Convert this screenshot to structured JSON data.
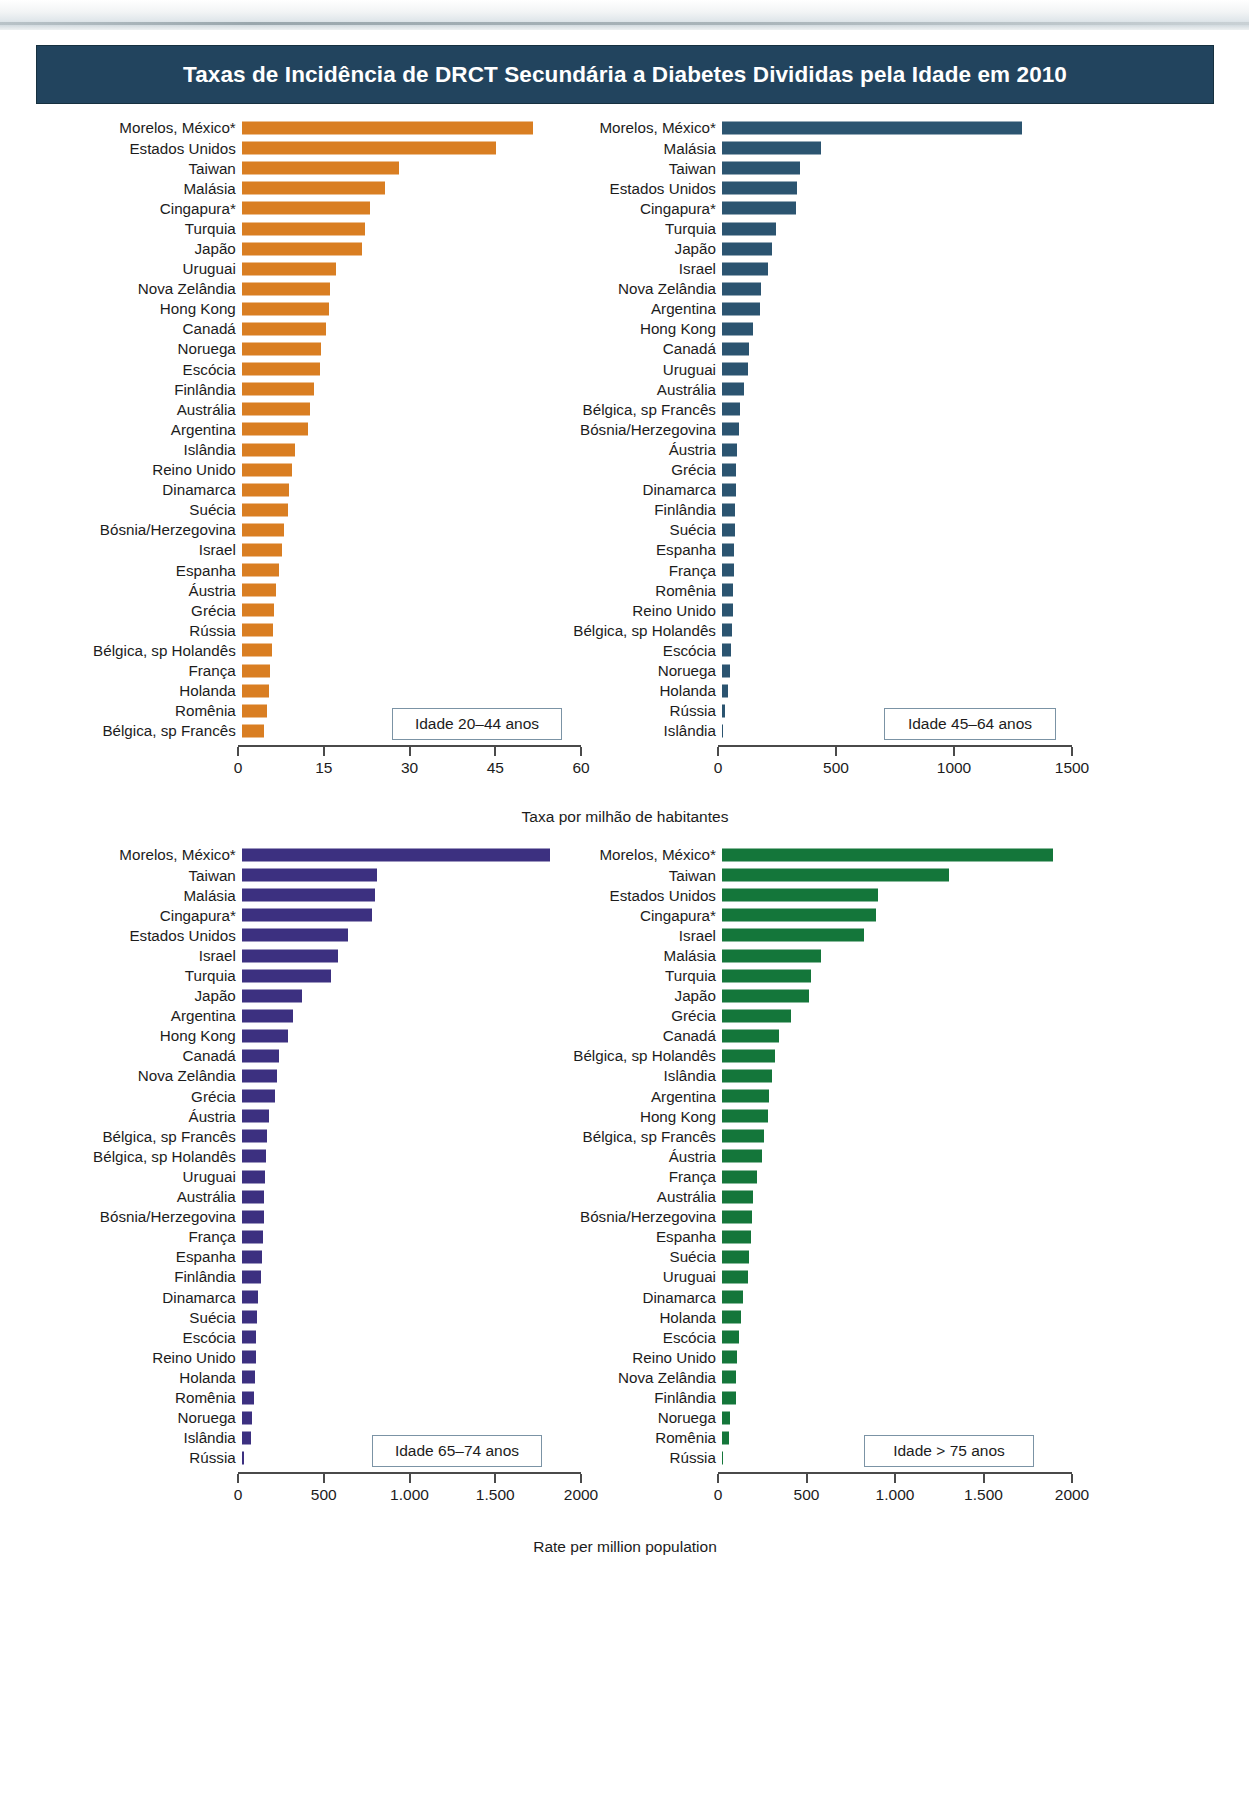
{
  "page": {
    "scan_ghost_text": "",
    "title": "Taxas de Incidência de DRCT Secundária a Diabetes Divididas pela Idade em 2010",
    "top_axis_title": "Taxa por milhão de habitantes",
    "bottom_axis_title": "Rate per million population"
  },
  "colors": {
    "banner_bg": "#22445e",
    "banner_text": "#ffffff",
    "orange": "#d97e22",
    "navy": "#2b5470",
    "purple": "#3c3080",
    "green": "#14763a",
    "axis": "#4a4a4a",
    "legend_border": "#7b93a5"
  },
  "legends": {
    "panel1": "Idade 20–44 anos",
    "panel2": "Idade 45–64 anos",
    "panel3": "Idade 65–74 anos",
    "panel4": "Idade > 75 anos"
  },
  "chart_data": [
    {
      "id": "panel1",
      "type": "bar",
      "orientation": "horizontal",
      "title": "Idade 20–44 anos",
      "color": "#d97e22",
      "xlabel": "Taxa por milhão de habitantes",
      "ylabel": "",
      "xlim": [
        0,
        60
      ],
      "xticks": [
        0,
        15,
        30,
        45,
        60
      ],
      "xtick_labels": [
        "0",
        "15",
        "30",
        "45",
        "60"
      ],
      "grid": false,
      "legend_position": "inside-bottom-right",
      "categories": [
        "Morelos, México*",
        "Estados Unidos",
        "Taiwan",
        "Malásia",
        "Cingapura*",
        "Turquia",
        "Japão",
        "Uruguai",
        "Nova Zelândia",
        "Hong Kong",
        "Canadá",
        "Noruega",
        "Escócia",
        "Finlândia",
        "Austrália",
        "Argentina",
        "Islândia",
        "Reino Unido",
        "Dinamarca",
        "Suécia",
        "Bósnia/Herzegovina",
        "Israel",
        "Espanha",
        "Áustria",
        "Grécia",
        "Rússia",
        "Bélgica, sp Holandês",
        "França",
        "Holanda",
        "Romênia",
        "Bélgica, sp Francês"
      ],
      "values": [
        51.0,
        44.5,
        27.5,
        25.0,
        22.5,
        21.5,
        21.0,
        16.5,
        15.5,
        15.3,
        14.8,
        13.8,
        13.6,
        12.6,
        12.0,
        11.5,
        9.3,
        8.7,
        8.3,
        8.0,
        7.3,
        7.0,
        6.5,
        5.9,
        5.7,
        5.5,
        5.3,
        4.9,
        4.8,
        4.4,
        3.8
      ]
    },
    {
      "id": "panel2",
      "type": "bar",
      "orientation": "horizontal",
      "title": "Idade 45–64 anos",
      "color": "#2b5470",
      "xlabel": "Taxa por milhão de habitantes",
      "ylabel": "",
      "xlim": [
        0,
        1500
      ],
      "xticks": [
        0,
        500,
        1000,
        1500
      ],
      "xtick_labels": [
        "0",
        "500",
        "1000",
        "1500"
      ],
      "grid": false,
      "legend_position": "inside-bottom-right",
      "categories": [
        "Morelos, México*",
        "Malásia",
        "Taiwan",
        "Estados Unidos",
        "Cingapura*",
        "Turquia",
        "Japão",
        "Israel",
        "Nova Zelândia",
        "Argentina",
        "Hong Kong",
        "Canadá",
        "Uruguai",
        "Austrália",
        "Bélgica, sp Francês",
        "Bósnia/Herzegovina",
        "Áustria",
        "Grécia",
        "Dinamarca",
        "Finlândia",
        "Suécia",
        "Espanha",
        "França",
        "Romênia",
        "Reino Unido",
        "Bélgica, sp Holandês",
        "Escócia",
        "Noruega",
        "Holanda",
        "Rússia",
        "Islândia"
      ],
      "values": [
        1270,
        420,
        330,
        320,
        315,
        230,
        210,
        195,
        165,
        160,
        130,
        115,
        110,
        95,
        78,
        72,
        62,
        60,
        58,
        56,
        54,
        52,
        50,
        48,
        46,
        44,
        38,
        32,
        26,
        15,
        3
      ]
    },
    {
      "id": "panel3",
      "type": "bar",
      "orientation": "horizontal",
      "title": "Idade 65–74 anos",
      "color": "#3c3080",
      "xlabel": "Rate per million population",
      "ylabel": "",
      "xlim": [
        0,
        2000
      ],
      "xticks": [
        0,
        500,
        1000,
        1500,
        2000
      ],
      "xtick_labels": [
        "0",
        "500",
        "1.000",
        "1.500",
        "2000"
      ],
      "grid": false,
      "legend_position": "inside-bottom-right",
      "categories": [
        "Morelos, México*",
        "Taiwan",
        "Malásia",
        "Cingapura*",
        "Estados Unidos",
        "Israel",
        "Turquia",
        "Japão",
        "Argentina",
        "Hong Kong",
        "Canadá",
        "Nova Zelândia",
        "Grécia",
        "Áustria",
        "Bélgica, sp Francês",
        "Bélgica, sp Holandês",
        "Uruguai",
        "Austrália",
        "Bósnia/Herzegovina",
        "França",
        "Espanha",
        "Finlândia",
        "Dinamarca",
        "Suécia",
        "Escócia",
        "Reino Unido",
        "Holanda",
        "Romênia",
        "Noruega",
        "Islândia",
        "Rússia"
      ],
      "values": [
        1800,
        790,
        775,
        760,
        620,
        560,
        520,
        350,
        300,
        270,
        215,
        205,
        195,
        160,
        145,
        140,
        135,
        132,
        128,
        122,
        115,
        110,
        92,
        88,
        85,
        82,
        78,
        72,
        60,
        55,
        12
      ]
    },
    {
      "id": "panel4",
      "type": "bar",
      "orientation": "horizontal",
      "title": "Idade > 75 anos",
      "color": "#14763a",
      "xlabel": "Rate per million population",
      "ylabel": "",
      "xlim": [
        0,
        2000
      ],
      "xticks": [
        0,
        500,
        1000,
        1500,
        2000
      ],
      "xtick_labels": [
        "0",
        "500",
        "1.000",
        "1.500",
        "2000"
      ],
      "grid": false,
      "legend_position": "inside-bottom-right",
      "categories": [
        "Morelos, México*",
        "Taiwan",
        "Estados Unidos",
        "Cingapura*",
        "Israel",
        "Malásia",
        "Turquia",
        "Japão",
        "Grécia",
        "Canadá",
        "Bélgica, sp Holandês",
        "Islândia",
        "Argentina",
        "Hong Kong",
        "Bélgica, sp Francês",
        "Áustria",
        "França",
        "Austrália",
        "Bósnia/Herzegovina",
        "Espanha",
        "Suécia",
        "Uruguai",
        "Dinamarca",
        "Holanda",
        "Escócia",
        "Reino Unido",
        "Nova Zelândia",
        "Finlândia",
        "Noruega",
        "Romênia",
        "Rússia"
      ],
      "values": [
        1870,
        1280,
        880,
        870,
        800,
        560,
        505,
        490,
        390,
        320,
        300,
        280,
        268,
        260,
        235,
        225,
        200,
        175,
        170,
        165,
        155,
        148,
        120,
        105,
        95,
        85,
        82,
        78,
        45,
        42,
        8
      ]
    }
  ]
}
